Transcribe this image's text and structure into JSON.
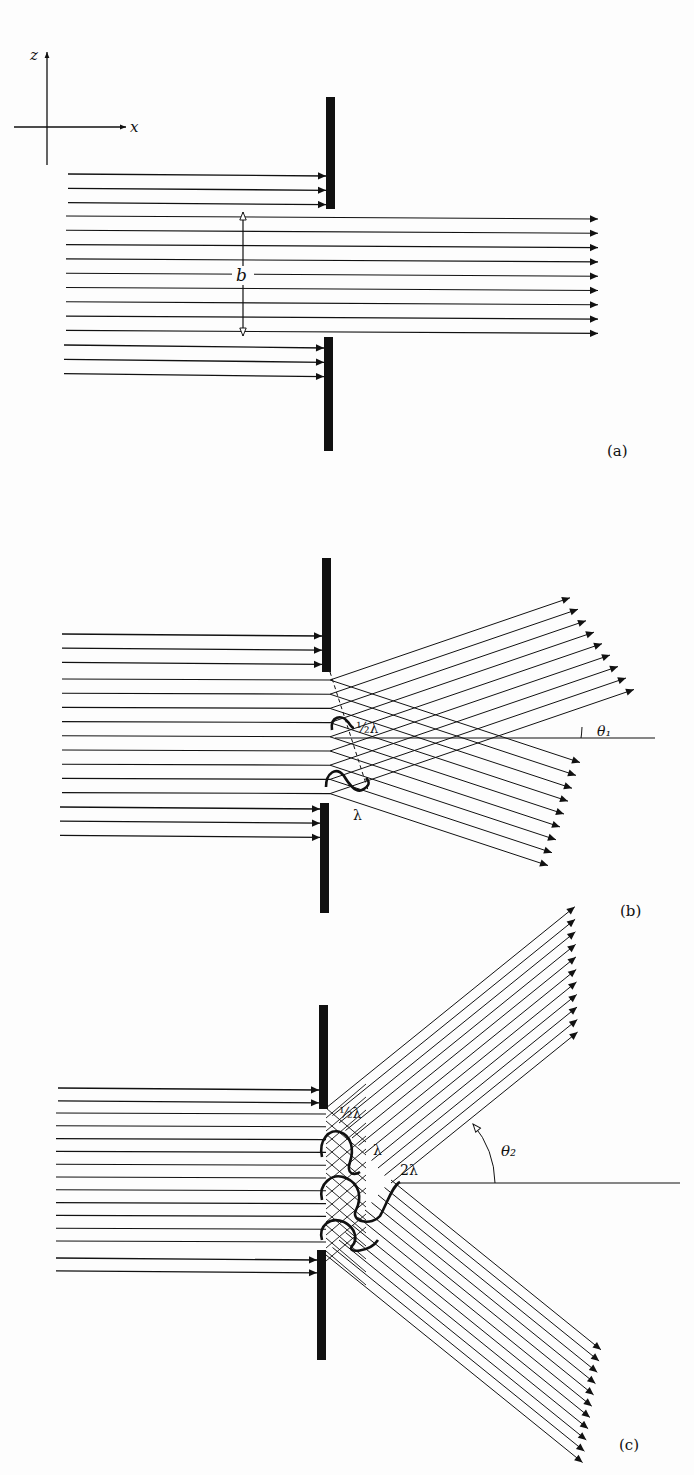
{
  "figure": {
    "axes": {
      "vertical_label": "z",
      "horizontal_label": "x"
    },
    "panels": [
      {
        "id": "a",
        "caption": "(a)",
        "description": "Plane wave passes straight through a slit of width b",
        "slit_width_label": "b"
      },
      {
        "id": "b",
        "caption": "(b)",
        "description": "First diffraction minimum at angle theta_1; path difference across slit equals one wavelength",
        "path_difference_labels": [
          "½λ",
          "λ"
        ],
        "angle_label": "θ₁"
      },
      {
        "id": "c",
        "caption": "(c)",
        "description": "Second diffraction minimum at angle theta_2; path difference across slit equals two wavelengths",
        "path_difference_labels": [
          "½λ",
          "λ",
          "2λ"
        ],
        "angle_label": "θ₂"
      }
    ],
    "colors": {
      "ink": "#111111",
      "background": "#fdfdfd"
    }
  }
}
